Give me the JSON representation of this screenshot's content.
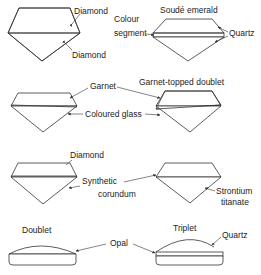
{
  "panels": [
    {
      "id": "diamond-doublet",
      "labels": [
        "Diamond",
        "Diamond"
      ]
    },
    {
      "id": "soude-emerald",
      "title": "Soudé emerald",
      "labels": [
        "Colour",
        "segment",
        "Quartz"
      ]
    },
    {
      "id": "garnet-row",
      "labels": [
        "Garnet",
        "Coloured glass"
      ]
    },
    {
      "id": "garnet-topped-doublet",
      "title": "Garnet-topped doublet"
    },
    {
      "id": "diamond-synthetic",
      "labels": [
        "Diamond",
        "Synthetic",
        "corundum"
      ]
    },
    {
      "id": "strontium",
      "labels": [
        "Strontium",
        "titanate"
      ]
    },
    {
      "id": "opal-doublet",
      "title": "Doublet"
    },
    {
      "id": "opal-triplet",
      "title": "Triplet",
      "labels": [
        "Opal",
        "Quartz"
      ]
    }
  ]
}
